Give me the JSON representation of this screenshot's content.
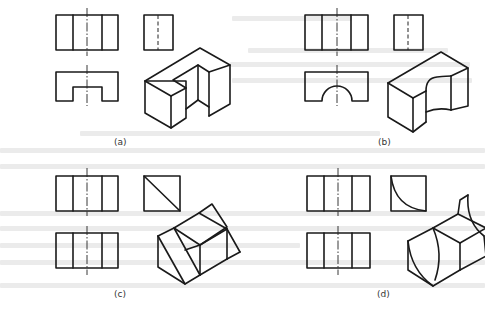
{
  "figure": {
    "type": "technical-drawing-three-views-with-isometric",
    "line_color": "#1a1a1a",
    "background": "#ffffff",
    "panels": [
      {
        "id": "a",
        "label": "(a)",
        "description": "front, side and top orthographic views of a U-shaped notched block with isometric sketch"
      },
      {
        "id": "b",
        "label": "(b)",
        "description": "front, side and top views of a block with a semicircular cut-out with isometric sketch"
      },
      {
        "id": "c",
        "label": "(c)",
        "description": "front, side (diagonal) and top views of a wedge-cut block with isometric sketch"
      },
      {
        "id": "d",
        "label": "(d)",
        "description": "front, side (quarter arc) and top views of a curved-cut block with isometric sketch"
      }
    ]
  }
}
